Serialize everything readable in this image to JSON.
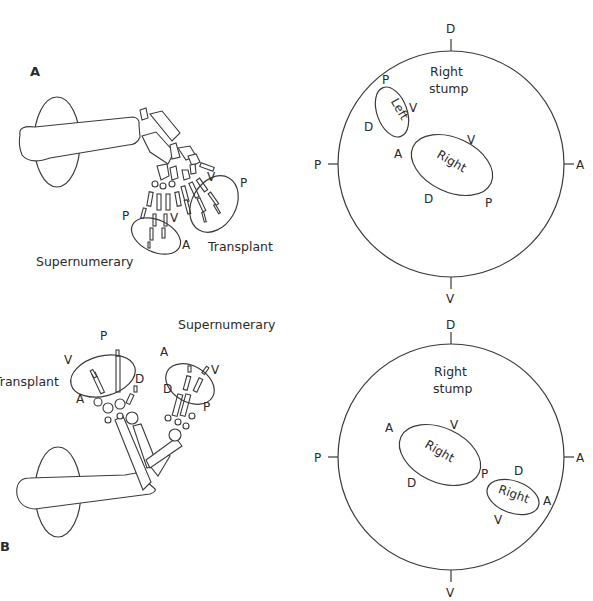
{
  "figure": {
    "panel_a": {
      "label": "A",
      "limb_labels": {
        "supernumerary": "Supernumerary",
        "transplant": "Transplant"
      },
      "supernumerary_axes": {
        "p": "P",
        "v": "V",
        "a": "A"
      },
      "transplant_axes": {
        "v": "V",
        "p": "P"
      },
      "stump_diagram": {
        "title_line1": "Right",
        "title_line2": "stump",
        "outer_axes": {
          "top": "D",
          "left": "P",
          "right": "A",
          "bottom": "V"
        },
        "ellipse_left": {
          "text": "Left",
          "p": "P",
          "v": "V",
          "d": "D",
          "a": "A"
        },
        "ellipse_right": {
          "text": "Right",
          "v": "V",
          "d": "D",
          "p": "P"
        }
      }
    },
    "panel_b": {
      "label": "B",
      "limb_labels": {
        "supernumerary": "Supernumerary",
        "transplant": "Transplant"
      },
      "transplant_axes": {
        "p": "P",
        "v": "V",
        "d": "D",
        "a": "A"
      },
      "supernumerary_axes": {
        "a": "A",
        "v": "V",
        "d": "D",
        "p": "P"
      },
      "stump_diagram": {
        "title_line1": "Right",
        "title_line2": "stump",
        "outer_axes": {
          "top": "D",
          "left": "P",
          "right": "A",
          "bottom": "V"
        },
        "ellipse_large": {
          "text": "Right",
          "a": "A",
          "v": "V",
          "d": "D",
          "p": "P"
        },
        "ellipse_small": {
          "text": "Right",
          "d": "D",
          "a": "A",
          "v": "V"
        }
      }
    }
  }
}
